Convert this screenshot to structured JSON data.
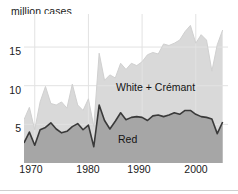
{
  "chart_data": {
    "type": "area",
    "title": "million cases",
    "subtitle": "",
    "xlabel": "",
    "ylabel": "million cases",
    "stacked": true,
    "grid": true,
    "legend_position": "inline-annotation",
    "xlim": [
      1968,
      2006
    ],
    "ylim": [
      0,
      18.5
    ],
    "xticks": [
      1970,
      1980,
      1990,
      2000
    ],
    "xtick_labels": [
      "1970",
      "1980",
      "1990",
      "2000"
    ],
    "yticks": [
      5,
      10,
      15
    ],
    "ytick_labels": [
      "5",
      "10",
      "15"
    ],
    "x": [
      1968,
      1969,
      1970,
      1971,
      1972,
      1973,
      1974,
      1975,
      1976,
      1977,
      1978,
      1979,
      1980,
      1981,
      1982,
      1983,
      1984,
      1985,
      1986,
      1987,
      1988,
      1989,
      1990,
      1991,
      1992,
      1993,
      1994,
      1995,
      1996,
      1997,
      1998,
      1999,
      2000,
      2001,
      2002,
      2003,
      2004,
      2005
    ],
    "series": [
      {
        "name": "Red",
        "color": "#a6a6a6",
        "line_color": "#3a3a3a",
        "values": [
          2.6,
          4.0,
          2.3,
          4.3,
          4.6,
          5.2,
          4.4,
          3.9,
          4.1,
          4.7,
          5.1,
          4.3,
          4.9,
          2.1,
          7.5,
          5.5,
          4.4,
          5.4,
          6.5,
          5.6,
          5.9,
          6.0,
          5.9,
          5.5,
          6.1,
          6.2,
          6.0,
          6.2,
          6.5,
          6.3,
          6.8,
          6.8,
          6.3,
          6.0,
          5.9,
          5.7,
          3.8,
          5.3
        ]
      },
      {
        "name": "White + Crémant",
        "color": "#d9d9d9",
        "line_color": "#d0d0d0",
        "values": [
          3.0,
          3.2,
          2.0,
          3.6,
          5.3,
          2.5,
          3.1,
          4.0,
          3.0,
          5.5,
          2.4,
          2.5,
          3.4,
          2.6,
          6.7,
          5.2,
          7.0,
          5.6,
          6.4,
          6.5,
          7.0,
          6.6,
          7.2,
          8.5,
          8.2,
          7.9,
          9.4,
          9.0,
          9.0,
          9.6,
          10.2,
          11.0,
          9.2,
          10.6,
          10.0,
          6.2,
          11.5,
          11.9
        ]
      }
    ],
    "totals_note": "Upper band is the stacked total of Red plus White + Crémant",
    "annotations": [
      {
        "name": "white-cremant-label",
        "text": "White + Crémant",
        "x": 1990,
        "y": 11.2
      },
      {
        "name": "red-label",
        "text": "Red",
        "x": 1990,
        "y": 4.4
      }
    ],
    "colors": {
      "red_band": "#a6a6a6",
      "white_band": "#d9d9d9",
      "red_line": "#3a3a3a",
      "grid": "#e2e2e2",
      "text": "#1a1a1a",
      "background": "#ffffff"
    }
  }
}
